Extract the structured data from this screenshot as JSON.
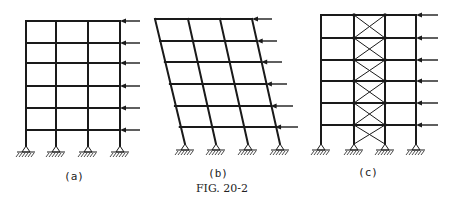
{
  "figure": {
    "caption": "Fig. 20-2",
    "caption_display": "FIG. 20-2",
    "ink_color": "#1a1a1a",
    "background": "#ffffff"
  },
  "panels": [
    {
      "id": "a",
      "label": "(a)",
      "description": "Rigid frame, 3 bays x 6 stories, lateral loads applied at each floor on right",
      "columns_top_x": [
        26,
        56,
        88,
        120
      ],
      "columns_base_x": [
        26,
        56,
        88,
        120
      ],
      "beam_y": [
        21,
        43,
        63,
        86,
        108,
        130
      ],
      "base_y": 152,
      "load_tail_x": 140,
      "label_x": 74,
      "label_y": 180
    },
    {
      "id": "b",
      "label": "(b)",
      "description": "Deflected (sway) shape of frame under lateral loads",
      "columns_top_x": [
        155,
        188,
        220,
        252
      ],
      "columns_base_x": [
        185,
        216,
        248,
        280
      ],
      "beam_y": [
        19,
        41,
        62,
        84,
        106,
        127
      ],
      "base_y": 150,
      "load_tail_x": [
        272,
        277,
        282,
        287,
        293,
        298
      ],
      "label_x": 218,
      "label_y": 177
    },
    {
      "id": "c",
      "label": "(c)",
      "description": "Frame with X-braced center bay (braced frame)",
      "columns_top_x": [
        321,
        354,
        385,
        416
      ],
      "columns_base_x": [
        321,
        354,
        385,
        416
      ],
      "beam_y": [
        15,
        38,
        60,
        81,
        103,
        125
      ],
      "base_y": 150,
      "braced_bay": [
        1,
        2
      ],
      "load_tail_x": 438,
      "label_x": 368,
      "label_y": 176
    }
  ]
}
